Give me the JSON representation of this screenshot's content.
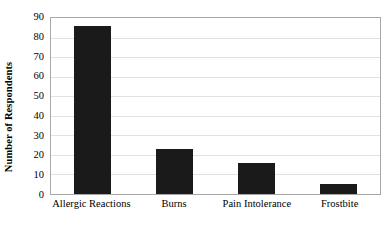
{
  "chart_data": {
    "type": "bar",
    "title": "",
    "xlabel": "",
    "ylabel": "Number of Respondents",
    "categories": [
      "Allergic Reactions",
      "Burns",
      "Pain Intolerance",
      "Frostbite"
    ],
    "values": [
      86,
      23,
      16,
      5
    ],
    "ylim": [
      0,
      90
    ],
    "yticks": [
      90,
      80,
      70,
      60,
      50,
      40,
      30,
      20,
      10,
      0
    ],
    "grid": true,
    "legend": "none",
    "bar_color": "#1a1a1a",
    "grid_color": "#e2e2e2",
    "axis_color": "#a8a8a8",
    "background": "#ffffff"
  }
}
